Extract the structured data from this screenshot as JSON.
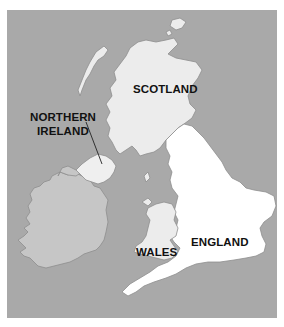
{
  "map": {
    "title": "United Kingdom and Ireland",
    "colors": {
      "sea": "#a9a9a9",
      "ireland": "#c6c6c6",
      "scotland": "#ececec",
      "northern_ireland": "#efefef",
      "wales": "#ececec",
      "england": "#ffffff",
      "coast": "#8e8e8e"
    },
    "labels": {
      "scotland": "SCOTLAND",
      "northern_ireland_line1": "NORTHERN",
      "northern_ireland_line2": "IRELAND",
      "wales": "WALES",
      "england": "ENGLAND"
    }
  }
}
